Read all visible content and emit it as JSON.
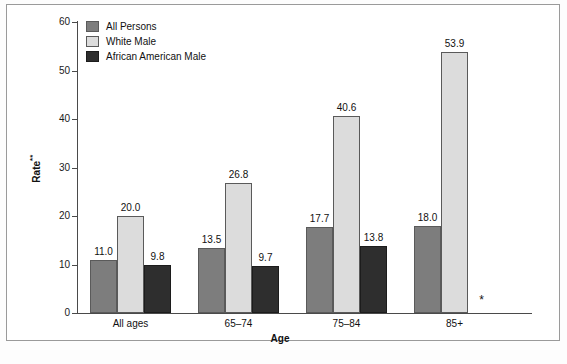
{
  "chart_data": {
    "type": "bar",
    "title": "",
    "xlabel": "Age",
    "ylabel": "Rate**",
    "ylabel_base": "Rate",
    "ylabel_superscript": "**",
    "categories": [
      "All ages",
      "65–74",
      "75–84",
      "85+"
    ],
    "series": [
      {
        "name": "All Persons",
        "color": "#7d7d7d",
        "values": [
          11.0,
          13.5,
          17.7,
          18.0
        ],
        "labels": [
          "11.0",
          "13.5",
          "17.7",
          "18.0"
        ]
      },
      {
        "name": "White Male",
        "color": "#dcdcdc",
        "values": [
          20.0,
          26.8,
          40.6,
          53.9
        ],
        "labels": [
          "20.0",
          "26.8",
          "40.6",
          "53.9"
        ]
      },
      {
        "name": "African American Male",
        "color": "#2e2e2e",
        "values": [
          9.8,
          9.7,
          13.8,
          null
        ],
        "labels": [
          "9.8",
          "9.7",
          "13.8",
          "*"
        ]
      }
    ],
    "ylim": [
      0,
      60
    ],
    "yticks": [
      0,
      10,
      20,
      30,
      40,
      50,
      60
    ],
    "ytick_labels": [
      "0",
      "10",
      "20",
      "30",
      "40",
      "50",
      "60"
    ],
    "grid": false,
    "legend_position": "top-left",
    "suppressed_marker": "*",
    "suppressed_note": "African American Male value for 85+ is suppressed and shown as an asterisk"
  },
  "legend": {
    "items": [
      {
        "label": "All Persons",
        "color": "#7d7d7d"
      },
      {
        "label": "White Male",
        "color": "#dcdcdc"
      },
      {
        "label": "African American Male",
        "color": "#2e2e2e"
      }
    ]
  }
}
